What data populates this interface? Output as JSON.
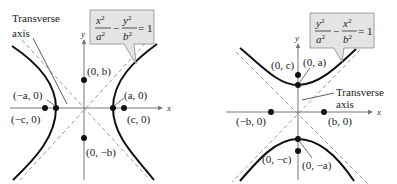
{
  "figures": [
    {
      "name": "horizontal-hyperbola",
      "equation": {
        "num1": "x",
        "den1": "a",
        "num2": "y",
        "den2": "b",
        "exp": "2",
        "minus": "−",
        "rhs": "= 1"
      },
      "axis_labels": {
        "x": "x",
        "y": "y"
      },
      "annotation": {
        "line1": "Transverse",
        "line2": "axis"
      },
      "points": [
        {
          "label": "(0, b)"
        },
        {
          "label": "(−a, 0)"
        },
        {
          "label": "(a, 0)"
        },
        {
          "label": "(−c, 0)"
        },
        {
          "label": "(c, 0)"
        },
        {
          "label": "(0, −b)"
        }
      ]
    },
    {
      "name": "vertical-hyperbola",
      "equation": {
        "num1": "y",
        "den1": "a",
        "num2": "x",
        "den2": "b",
        "exp": "2",
        "minus": "−",
        "rhs": "= 1"
      },
      "axis_labels": {
        "x": "x",
        "y": "y"
      },
      "annotation": {
        "line1": "Transverse",
        "line2": "axis"
      },
      "points": [
        {
          "label": "(0, c)"
        },
        {
          "label": "(0, a)"
        },
        {
          "label": "(−b, 0)"
        },
        {
          "label": "(b, 0)"
        },
        {
          "label": "(0, −c)"
        },
        {
          "label": "(0, −a)"
        }
      ]
    }
  ],
  "colors": {
    "curve": "#111111",
    "axis": "#777777",
    "asymptote": "#9a9a9a",
    "callout_fill": "#e4e4e4",
    "callout_border": "#8a8a8a"
  }
}
